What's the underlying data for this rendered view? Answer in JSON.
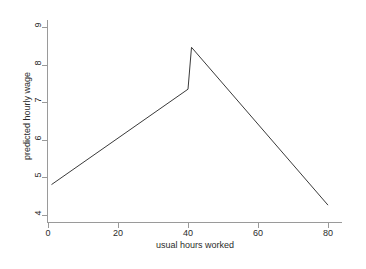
{
  "chart_data": {
    "type": "line",
    "title": "",
    "xlabel": "usual hours worked",
    "ylabel": "predicted hourly wage",
    "xlim": [
      0,
      84
    ],
    "ylim": [
      3.8,
      9.2
    ],
    "xticks": [
      0,
      20,
      40,
      60,
      80
    ],
    "yticks": [
      4,
      5,
      6,
      7,
      8,
      9
    ],
    "xtick_labels": [
      "0",
      "20",
      "40",
      "60",
      "80"
    ],
    "ytick_labels": [
      "4",
      "5",
      "6",
      "7",
      "8",
      "9"
    ],
    "grid": false,
    "legend": "none",
    "line_color": "#3a3a3a",
    "axis_color": "#9a9a9a",
    "background": "#ffffff",
    "series": [
      {
        "name": "predicted hourly wage (segment 1)",
        "x": [
          1,
          40
        ],
        "y": [
          4.8,
          7.35
        ]
      },
      {
        "name": "discontinuity jump at 40 hours",
        "x": [
          40,
          41
        ],
        "y": [
          7.35,
          8.47
        ]
      },
      {
        "name": "predicted hourly wage (segment 2)",
        "x": [
          41,
          80
        ],
        "y": [
          8.47,
          4.25
        ]
      }
    ],
    "annotations": []
  }
}
